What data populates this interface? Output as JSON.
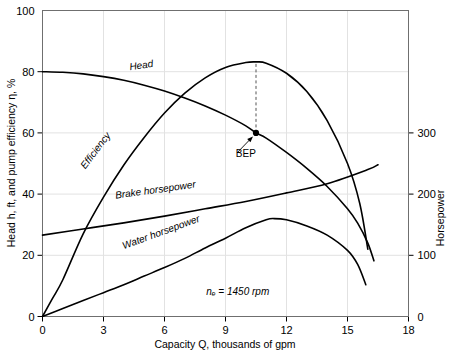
{
  "chart_data": {
    "type": "line",
    "title": "",
    "xlabel": "Capacity Q, thousands of gpm",
    "ylabel": "Head h, ft, and pump efficiency η, %",
    "y2label": "Horsepower",
    "xlim": [
      0,
      18
    ],
    "ylim": [
      0,
      100
    ],
    "y2lim": [
      0,
      500
    ],
    "grid": true,
    "legend_position": "inline-curve-labels",
    "xticks": [
      "0",
      "3",
      "6",
      "9",
      "12",
      "15",
      "18"
    ],
    "xtick_values": [
      0,
      3,
      6,
      9,
      12,
      15,
      18
    ],
    "yticks": [
      "0",
      "20",
      "40",
      "60",
      "80",
      "100"
    ],
    "ytick_values": [
      0,
      20,
      40,
      60,
      80,
      100
    ],
    "y2ticks": [
      "0",
      "100",
      "200",
      "300"
    ],
    "y2tick_values": [
      0,
      100,
      200,
      300
    ],
    "annotations": [
      {
        "name": "speed-note",
        "text": "nₑ = 1450 rpm",
        "x": 9.6,
        "y": 7
      },
      {
        "name": "bep-label",
        "text": "BEP",
        "x": 10.0,
        "y": 52
      }
    ],
    "bep_point": {
      "x": 10.5,
      "y": 60,
      "label": "BEP"
    },
    "series": [
      {
        "name": "Head",
        "label": "Head",
        "axis": "left",
        "label_x": 4.3,
        "label_y": 80.5,
        "label_rotation": -8,
        "x": [
          0.0,
          1.0,
          2.0,
          3.0,
          4.0,
          5.0,
          6.0,
          7.0,
          8.0,
          9.0,
          10.0,
          10.5,
          11.0,
          12.0,
          13.0,
          14.0,
          15.0,
          15.5,
          16.0,
          16.3
        ],
        "y": [
          80.0,
          79.8,
          79.3,
          78.4,
          77.2,
          75.6,
          73.7,
          71.4,
          68.8,
          65.8,
          62.3,
          60.0,
          58.3,
          53.6,
          48.4,
          42.5,
          35.2,
          30.5,
          24.0,
          18.2
        ]
      },
      {
        "name": "Efficiency",
        "label": "Efficiency",
        "axis": "left",
        "label_x": 2.1,
        "label_y": 48,
        "label_rotation": -53,
        "x": [
          0.0,
          0.5,
          1.0,
          2.0,
          3.0,
          4.0,
          5.0,
          6.0,
          7.0,
          8.0,
          9.0,
          10.0,
          10.5,
          11.0,
          12.0,
          13.0,
          14.0,
          15.0,
          15.6,
          16.0
        ],
        "y": [
          0.0,
          6.0,
          12.0,
          27.0,
          39.0,
          49.5,
          58.5,
          66.5,
          73.0,
          78.0,
          81.4,
          83.0,
          83.2,
          82.8,
          79.5,
          73.5,
          64.0,
          50.0,
          37.0,
          22.0
        ]
      },
      {
        "name": "Brake horsepower",
        "label": "Brake horsepower",
        "axis": "right",
        "label_x": 3.6,
        "label_y": 38.5,
        "label_rotation": -8,
        "x": [
          0.0,
          2.0,
          4.0,
          6.0,
          8.0,
          10.0,
          12.0,
          14.0,
          16.0,
          16.5
        ],
        "y_right": [
          133,
          143,
          153,
          164,
          176,
          188,
          202,
          217,
          240,
          248
        ]
      },
      {
        "name": "Water horsepower",
        "label": "Water horsepower",
        "axis": "right",
        "label_x": 4.0,
        "label_y": 22.0,
        "label_rotation": -20,
        "x": [
          0.0,
          1.0,
          2.0,
          3.0,
          4.0,
          5.0,
          6.0,
          7.0,
          8.0,
          9.0,
          10.0,
          11.0,
          11.4,
          12.0,
          13.0,
          14.0,
          15.0,
          15.5,
          15.9
        ],
        "y_right": [
          0,
          13,
          26,
          39,
          52,
          66,
          80,
          95,
          112,
          128,
          145,
          158,
          160,
          158,
          148,
          133,
          108,
          85,
          52
        ]
      }
    ]
  },
  "axes": {
    "left_title": "Head h, ft, and pump efficiency η, %",
    "bottom_title": "Capacity Q, thousands of gpm",
    "right_title": "Horsepower"
  }
}
